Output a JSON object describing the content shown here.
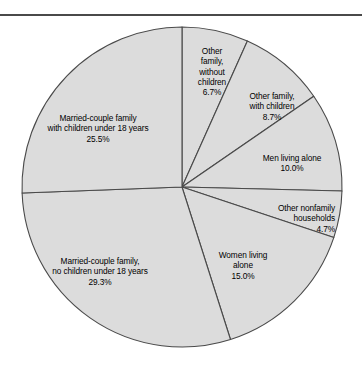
{
  "figure": {
    "background_color": "#ffffff",
    "rule_color": "#4a4a4a",
    "slice_fill_color": "#dcdcdc",
    "slice_outline_color": "#4a4a4a"
  },
  "chart_data": {
    "type": "pie",
    "title": "",
    "subtitle": "",
    "xlabel": "",
    "ylabel": "",
    "grid": false,
    "legend_position": "none",
    "label_style": "inside-slice",
    "start_angle_deg": 0,
    "direction": "clockwise",
    "center_px": [
      182,
      187
    ],
    "radius_px": 160,
    "units": "percent",
    "total": 99.9,
    "categories": [
      "Other family, without children",
      "Other family, with children",
      "Men living alone",
      "Other nonfamily households",
      "Women living alone",
      "Married-couple family, no children under 18 years",
      "Married-couple family with children under 18 years"
    ],
    "values": [
      6.7,
      8.7,
      10.0,
      4.7,
      15.0,
      29.3,
      25.5
    ],
    "slices": [
      {
        "name": "other-family-without-children",
        "label_lines": "Other\nfamily,\nwithout\nchildren",
        "percent": "6.7%",
        "value": 6.7,
        "start_deg": 0,
        "end_deg": 24.12
      },
      {
        "name": "other-family-with-children",
        "label_lines": "Other family,\nwith children",
        "percent": "8.7%",
        "value": 8.7,
        "start_deg": 24.12,
        "end_deg": 55.44
      },
      {
        "name": "men-living-alone",
        "label_lines": "Men living alone",
        "percent": "10.0%",
        "value": 10.0,
        "start_deg": 55.44,
        "end_deg": 91.44
      },
      {
        "name": "other-nonfamily-households",
        "label_lines": "Other nonfamily\nhouseholds",
        "percent": "4.7%",
        "value": 4.7,
        "start_deg": 91.44,
        "end_deg": 108.36
      },
      {
        "name": "women-living-alone",
        "label_lines": "Women living\nalone",
        "percent": "15.0%",
        "value": 15.0,
        "start_deg": 108.36,
        "end_deg": 162.36
      },
      {
        "name": "married-couple-no-children",
        "label_lines": "Married-couple family,\nno children under 18 years",
        "percent": "29.3%",
        "value": 29.3,
        "start_deg": 162.36,
        "end_deg": 267.84
      },
      {
        "name": "married-couple-with-children",
        "label_lines": "Married-couple family\nwith children under 18 years",
        "percent": "25.5%",
        "value": 25.5,
        "start_deg": 267.84,
        "end_deg": 360
      }
    ]
  }
}
